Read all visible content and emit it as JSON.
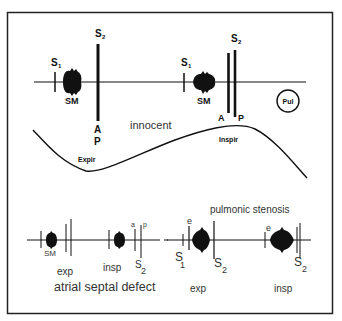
{
  "top_panel": {
    "beat1": {
      "s1": "S",
      "s1_sub": "1",
      "sm": "SM",
      "s2": "S",
      "s2_sub": "2",
      "a": "A",
      "p": "P"
    },
    "beat2": {
      "s1": "S",
      "s1_sub": "1",
      "sm": "SM",
      "s2": "S",
      "s2_sub": "2",
      "a": "A",
      "p": "P"
    },
    "innocent_label": "innocent",
    "pul_label": "Pul",
    "expir_label": "Expir",
    "inspir_label": "Inspir"
  },
  "asd_panel": {
    "sm": "SM",
    "exp": "exp",
    "insp": "insp",
    "a": "a",
    "p": "p",
    "s2": "S",
    "s2_sub": "2",
    "title": "atrial septal defect"
  },
  "ps_panel": {
    "title": "pulmonic stenosis",
    "exp_beat": {
      "e": "e",
      "s1": "S",
      "s1_sub": "1",
      "s2": "S",
      "s2_sub": "2"
    },
    "insp_beat": {
      "e": "e",
      "s2": "S",
      "s2_sub": "2"
    },
    "exp": "exp",
    "insp": "insp"
  }
}
